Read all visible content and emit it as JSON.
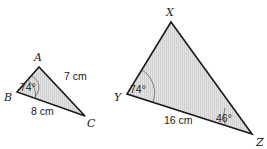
{
  "figure": {
    "type": "similar-triangles",
    "colors": {
      "fill": "#dcdcdc",
      "stroke": "#1a1a1a",
      "text": "#222222"
    }
  },
  "triangle_small": {
    "vertices": {
      "A": {
        "label": "A",
        "x": 39,
        "y": 67
      },
      "B": {
        "label": "B",
        "x": 17,
        "y": 92
      },
      "C": {
        "label": "C",
        "x": 85,
        "y": 116
      }
    },
    "angles": [
      {
        "vertex": "B",
        "label": "74°"
      }
    ],
    "sides": [
      {
        "between": "AC",
        "label": "7 cm"
      },
      {
        "between": "BC",
        "label": "8 cm"
      }
    ]
  },
  "triangle_large": {
    "vertices": {
      "X": {
        "label": "X",
        "x": 171,
        "y": 22
      },
      "Y": {
        "label": "Y",
        "x": 127,
        "y": 94
      },
      "Z": {
        "label": "Z",
        "x": 252,
        "y": 134
      }
    },
    "angles": [
      {
        "vertex": "Y",
        "label": "74°"
      },
      {
        "vertex": "Z",
        "label": "46°"
      }
    ],
    "sides": [
      {
        "between": "YZ",
        "label": "16 cm"
      }
    ]
  }
}
